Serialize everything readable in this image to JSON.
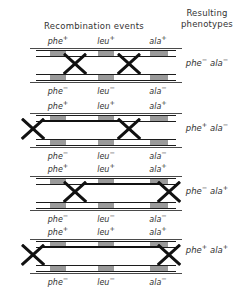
{
  "headers": {
    "recombination": "Recombination events",
    "resulting_line1": "Resulting",
    "resulting_line2": "phenotypes"
  },
  "genes": {
    "phe": "phe",
    "leu": "leu",
    "ala": "ala",
    "plus": "+",
    "minus": "−"
  },
  "panels": [
    {
      "id": "panel-1",
      "top_alleles": [
        {
          "gene": "phe",
          "sup": "+"
        },
        {
          "gene": "leu",
          "sup": "+"
        },
        {
          "gene": "ala",
          "sup": "+"
        }
      ],
      "bottom_alleles": [
        {
          "gene": "phe",
          "sup": "−"
        },
        {
          "gene": "leu",
          "sup": "−"
        },
        {
          "gene": "ala",
          "sup": "−"
        }
      ],
      "crossovers": [
        "inner-left",
        "inner-right"
      ],
      "phenotype": "phe− ala−",
      "phenotype_parts": [
        {
          "gene": "phe",
          "sup": "−"
        },
        {
          "gene": "ala",
          "sup": "−"
        }
      ]
    },
    {
      "id": "panel-2",
      "top_alleles": [
        {
          "gene": "phe",
          "sup": "+"
        },
        {
          "gene": "leu",
          "sup": "+"
        },
        {
          "gene": "ala",
          "sup": "+"
        }
      ],
      "bottom_alleles": [
        {
          "gene": "phe",
          "sup": "−"
        },
        {
          "gene": "leu",
          "sup": "−"
        },
        {
          "gene": "ala",
          "sup": "−"
        }
      ],
      "crossovers": [
        "far-left",
        "inner-right"
      ],
      "phenotype": "phe+ ala−",
      "phenotype_parts": [
        {
          "gene": "phe",
          "sup": "+"
        },
        {
          "gene": "ala",
          "sup": "−"
        }
      ]
    },
    {
      "id": "panel-3",
      "top_alleles": [
        {
          "gene": "phe",
          "sup": "+"
        },
        {
          "gene": "leu",
          "sup": "+"
        },
        {
          "gene": "ala",
          "sup": "+"
        }
      ],
      "bottom_alleles": [
        {
          "gene": "phe",
          "sup": "−"
        },
        {
          "gene": "leu",
          "sup": "−"
        },
        {
          "gene": "ala",
          "sup": "−"
        }
      ],
      "crossovers": [
        "inner-left",
        "far-right"
      ],
      "phenotype": "phe− ala+",
      "phenotype_parts": [
        {
          "gene": "phe",
          "sup": "−"
        },
        {
          "gene": "ala",
          "sup": "+"
        }
      ]
    },
    {
      "id": "panel-4",
      "top_alleles": [
        {
          "gene": "phe",
          "sup": "+"
        },
        {
          "gene": "leu",
          "sup": "+"
        },
        {
          "gene": "ala",
          "sup": "+"
        }
      ],
      "bottom_alleles": [
        {
          "gene": "phe",
          "sup": "−"
        },
        {
          "gene": "leu",
          "sup": "−"
        },
        {
          "gene": "ala",
          "sup": "−"
        }
      ],
      "crossovers": [
        "far-left",
        "far-right"
      ],
      "phenotype": "phe+ ala+",
      "phenotype_parts": [
        {
          "gene": "phe",
          "sup": "+"
        },
        {
          "gene": "ala",
          "sup": "+"
        }
      ]
    }
  ],
  "colors": {
    "ink": "#1c1c1c",
    "text": "#333333",
    "marker": "#9a9a9a",
    "background": "#ffffff"
  }
}
